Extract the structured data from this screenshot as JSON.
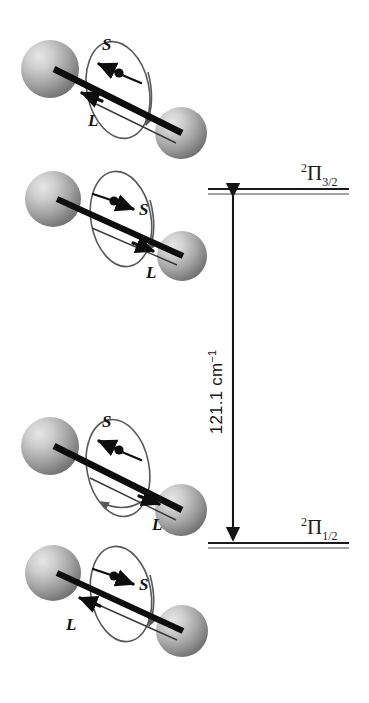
{
  "figure": {
    "background_color": "#ffffff",
    "ink_color": "#111111",
    "sphere_color_light": "#d8d8d8",
    "sphere_color_mid": "#9a9a9a",
    "sphere_color_dark": "#6d6d6d"
  },
  "energy_levels": [
    {
      "id": "upper",
      "name": "upper-energy-level",
      "term_superscript": "2",
      "term_symbol": "Π",
      "term_subscript": "3/2",
      "label_full": "2Π3/2",
      "line_y": 191,
      "line_x_start": 208,
      "line_x_end": 349
    },
    {
      "id": "lower",
      "name": "lower-energy-level",
      "term_superscript": "2",
      "term_symbol": "Π",
      "term_subscript": "1/2",
      "label_full": "2Π1/2",
      "line_y": 545,
      "line_x_start": 208,
      "line_x_end": 349
    }
  ],
  "splitting": {
    "value": "121.1",
    "unit_base": "cm",
    "unit_exponent": "−1",
    "label": "121.1 cm−1",
    "arrow_x": 233,
    "arrow_top_y": 192,
    "arrow_bottom_y": 544,
    "orientation": "vertical-double-headed"
  },
  "molecules": [
    {
      "id": "m1",
      "name": "molecule-upper-1",
      "belongs_to_level": "upper",
      "spin_label": "S",
      "orbital_label": "L",
      "spin_direction": "left",
      "orbital_direction": "left",
      "spin_label_side": "above-left",
      "orbital_label_side": "below-left"
    },
    {
      "id": "m2",
      "name": "molecule-upper-2",
      "belongs_to_level": "upper",
      "spin_label": "S",
      "orbital_label": "L",
      "spin_direction": "right",
      "orbital_direction": "right",
      "spin_label_side": "right",
      "orbital_label_side": "below-right"
    },
    {
      "id": "m3",
      "name": "molecule-lower-1",
      "belongs_to_level": "lower",
      "spin_label": "S",
      "orbital_label": "L",
      "spin_direction": "left",
      "orbital_direction": "right",
      "spin_label_side": "above-left",
      "orbital_label_side": "below-right"
    },
    {
      "id": "m4",
      "name": "molecule-lower-2",
      "belongs_to_level": "lower",
      "spin_label": "S",
      "orbital_label": "L",
      "spin_direction": "right",
      "orbital_direction": "left",
      "spin_label_side": "right",
      "orbital_label_side": "below-left"
    }
  ]
}
